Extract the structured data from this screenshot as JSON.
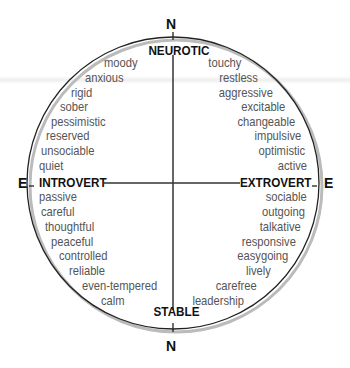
{
  "compass": {
    "top": "N",
    "bottom": "N",
    "left": "E",
    "right": "E"
  },
  "axes": {
    "top": "NEUROTIC",
    "bottom": "STABLE",
    "left": "INTROVERT",
    "right": "EXTROVERT"
  },
  "quadrants": {
    "top_left": [
      "moody",
      "anxious",
      "rigid",
      "sober",
      "pessimistic",
      "reserved",
      "unsociable",
      "quiet"
    ],
    "top_right": [
      "touchy",
      "restless",
      "aggressive",
      "excitable",
      "changeable",
      "impulsive",
      "optimistic",
      "active"
    ],
    "bottom_left": [
      "passive",
      "careful",
      "thoughtful",
      "peaceful",
      "controlled",
      "reliable",
      "even-tempered",
      "calm"
    ],
    "bottom_right": [
      "sociable",
      "outgoing",
      "talkative",
      "responsive",
      "easygoing",
      "lively",
      "carefree",
      "leadership"
    ]
  },
  "colors": {
    "line": "#222222",
    "trait_text": "#555555",
    "axis_text": "#111111",
    "shadow": "#bbbbbb"
  }
}
